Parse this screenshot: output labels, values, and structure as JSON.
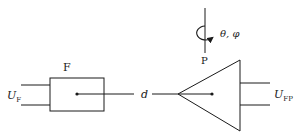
{
  "diagram": {
    "source_block": {
      "label": "F",
      "input_label_main": "U",
      "input_label_sub": "F"
    },
    "connection": {
      "label": "d"
    },
    "receiver": {
      "label": "P",
      "rotation_label": "θ, φ",
      "output_label_main": "U",
      "output_label_sub": "FP"
    },
    "colors": {
      "stroke": "#1a1a1a",
      "background": "#ffffff"
    }
  }
}
